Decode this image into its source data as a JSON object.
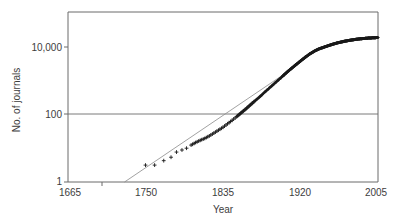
{
  "chart_data": {
    "type": "scatter",
    "title": "",
    "xlabel": "Year",
    "ylabel": "No. of journals",
    "xlim": [
      1665,
      2005
    ],
    "ylim": [
      1,
      63000
    ],
    "yscale": "log",
    "xscale": "linear",
    "xticks": [
      1665,
      1750,
      1835,
      1920,
      2005
    ],
    "xticklabels": [
      "1665",
      "1750",
      "1835",
      "1920",
      "2005"
    ],
    "yticks": [
      1,
      100,
      10000
    ],
    "yticklabels": [
      "1",
      "100",
      "10,000"
    ],
    "grid": "horizontal-at-100",
    "legend": "none",
    "marker": "plus",
    "marker_color": "#1a1a1a",
    "frame_color": "#6b6b6b",
    "gridline_color": "#6b6b6b",
    "series": [
      {
        "name": "No. of journals",
        "x": [
          1750,
          1760,
          1770,
          1778,
          1784,
          1790,
          1795,
          1800,
          1805,
          1810,
          1815,
          1820,
          1825,
          1830,
          1835,
          1840,
          1845,
          1850,
          1855,
          1860,
          1865,
          1870,
          1875,
          1880,
          1885,
          1890,
          1895,
          1900,
          1905,
          1910,
          1915,
          1920,
          1925,
          1930,
          1935,
          1940,
          1945,
          1950,
          1955,
          1960,
          1965,
          1970,
          1975,
          1980,
          1985,
          1990,
          1995,
          2000,
          2005
        ],
        "y": [
          3,
          3,
          4,
          5,
          7,
          8,
          9,
          11,
          13,
          15,
          17,
          20,
          24,
          29,
          35,
          44,
          55,
          70,
          90,
          115,
          150,
          195,
          250,
          330,
          430,
          560,
          730,
          950,
          1250,
          1600,
          2050,
          2600,
          3300,
          4100,
          4900,
          5700,
          6300,
          7000,
          7700,
          8400,
          9000,
          9600,
          10100,
          10600,
          11000,
          11300,
          11600,
          11800,
          12000
        ]
      }
    ],
    "fit_line": {
      "name": "exponential fit",
      "x_start": 1727,
      "y_start": 1,
      "x_end": 1905,
      "y_end": 1250,
      "color": "#8a8a8a"
    },
    "annotations": []
  },
  "axes": {
    "y_title": "No. of journals",
    "x_title": "Year",
    "y_tick_1": "1",
    "y_tick_100": "100",
    "y_tick_10000": "10,000",
    "x_tick_1665": "1665",
    "x_tick_1750": "1750",
    "x_tick_1835": "1835",
    "x_tick_1920": "1920",
    "x_tick_2005": "2005"
  }
}
